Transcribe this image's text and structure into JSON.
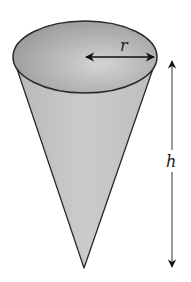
{
  "diagram": {
    "labels": {
      "radius": "r",
      "height": "h"
    },
    "colors": {
      "top_ellipse_fill": "#9a9a9a",
      "cone_body_fill": "#c4c4c4",
      "outline": "#2a2a2a",
      "arrow": "#111111",
      "background": "#ffffff"
    }
  }
}
